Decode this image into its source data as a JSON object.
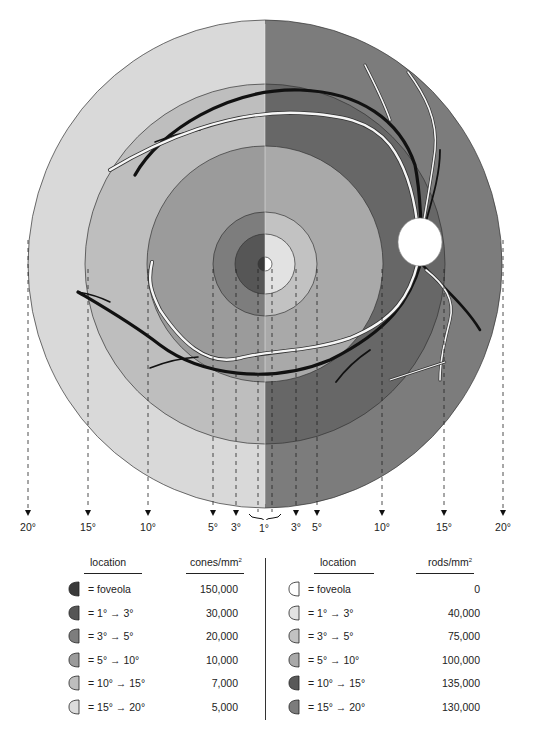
{
  "figure": {
    "center": {
      "x": 265,
      "y": 264
    },
    "split_line": "vertical at center; left half = cone density shading, right half = rod density shading",
    "rings": [
      {
        "name": "20deg",
        "radius": 240,
        "left_color": "#d9d9d9",
        "right_color": "#7c7c7c"
      },
      {
        "name": "15deg",
        "radius": 180,
        "left_color": "#bebebe",
        "right_color": "#676767"
      },
      {
        "name": "10deg",
        "radius": 118,
        "left_color": "#9b9b9b",
        "right_color": "#a9a9a9"
      },
      {
        "name": "5deg",
        "radius": 52,
        "left_color": "#7d7d7d",
        "right_color": "#c2c2c2"
      },
      {
        "name": "3deg",
        "radius": 30,
        "left_color": "#565656",
        "right_color": "#e2e2e2"
      },
      {
        "name": "foveola",
        "radius": 7,
        "left_color": "#3a3a3a",
        "right_color": "#ffffff"
      }
    ],
    "optic_disc": {
      "x": 420,
      "y": 242,
      "rx": 22,
      "ry": 24,
      "color": "#ffffff"
    }
  },
  "axis": {
    "labels": [
      {
        "text": "20°",
        "x": 28
      },
      {
        "text": "15°",
        "x": 88
      },
      {
        "text": "10°",
        "x": 148
      },
      {
        "text": "5°",
        "x": 213
      },
      {
        "text": "3°",
        "x": 236
      },
      {
        "text": "1°",
        "x": 264
      },
      {
        "text": "3°",
        "x": 296
      },
      {
        "text": "5°",
        "x": 317
      },
      {
        "text": "10°",
        "x": 382
      },
      {
        "text": "15°",
        "x": 444
      },
      {
        "text": "20°",
        "x": 503
      }
    ]
  },
  "cones_table": {
    "location_header": "location",
    "value_header": "cones/mm",
    "value_header_sup": "2",
    "rows": [
      {
        "location": "= foveola",
        "value": "150,000",
        "shade": "#3a3a3a"
      },
      {
        "location": "= 1° → 3°",
        "value": "30,000",
        "shade": "#565656"
      },
      {
        "location": "= 3° → 5°",
        "value": "20,000",
        "shade": "#7d7d7d"
      },
      {
        "location": "= 5° → 10°",
        "value": "10,000",
        "shade": "#9b9b9b"
      },
      {
        "location": "= 10° → 15°",
        "value": "7,000",
        "shade": "#bebebe"
      },
      {
        "location": "= 15° → 20°",
        "value": "5,000",
        "shade": "#dcdcdc"
      }
    ]
  },
  "rods_table": {
    "location_header": "location",
    "value_header": "rods/mm",
    "value_header_sup": "2",
    "rows": [
      {
        "location": "= foveola",
        "value": "0",
        "shade": "#ffffff"
      },
      {
        "location": "= 1° → 3°",
        "value": "40,000",
        "shade": "#e2e2e2"
      },
      {
        "location": "= 3° → 5°",
        "value": "75,000",
        "shade": "#c2c2c2"
      },
      {
        "location": "= 5° → 10°",
        "value": "100,000",
        "shade": "#a9a9a9"
      },
      {
        "location": "= 10° → 15°",
        "value": "135,000",
        "shade": "#595959"
      },
      {
        "location": "= 15° → 20°",
        "value": "130,000",
        "shade": "#7c7c7c"
      }
    ]
  }
}
